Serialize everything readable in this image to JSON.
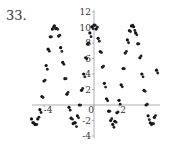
{
  "problem_number": "33.",
  "chart_data": {
    "type": "scatter",
    "title": "",
    "xlabel": "",
    "ylabel": "",
    "xlim": [
      -5.2,
      6.2
    ],
    "ylim": [
      -4.5,
      12.5
    ],
    "grid": false,
    "legend": null,
    "x_ticks": [
      -4,
      0,
      2
    ],
    "x_tick_labels": [
      "-4",
      "0",
      "2"
    ],
    "y_ticks": [
      -4,
      -2,
      2,
      4,
      6,
      8,
      10,
      12
    ],
    "y_tick_labels": [
      "-4",
      "-2",
      "2",
      "4",
      "6",
      "8",
      "10",
      "12"
    ],
    "approx_model": "y ≈ 4 + 6.3·cos(1.57·(x − 0.15))",
    "points": [
      [
        -5.0,
        -1.8
      ],
      [
        -4.83,
        -2.3
      ],
      [
        -4.67,
        -2.5
      ],
      [
        -4.5,
        -1.8
      ],
      [
        -4.33,
        -0.6
      ],
      [
        -4.17,
        1.1
      ],
      [
        -4.0,
        3.1
      ],
      [
        -3.83,
        5.1
      ],
      [
        -3.67,
        7.2
      ],
      [
        -3.5,
        8.8
      ],
      [
        -3.33,
        9.8
      ],
      [
        -3.17,
        10.2
      ],
      [
        -3.0,
        9.9
      ],
      [
        -2.83,
        8.9
      ],
      [
        -2.67,
        7.4
      ],
      [
        -2.5,
        5.5
      ],
      [
        -2.33,
        3.4
      ],
      [
        -2.17,
        1.4
      ],
      [
        -2.0,
        -0.3
      ],
      [
        -1.83,
        -1.7
      ],
      [
        -1.67,
        -2.4
      ],
      [
        -1.5,
        -2.3
      ],
      [
        -1.33,
        -1.4
      ],
      [
        -1.17,
        0.0
      ],
      [
        -1.0,
        1.9
      ],
      [
        -0.83,
        4.0
      ],
      [
        -0.67,
        6.1
      ],
      [
        -0.5,
        7.9
      ],
      [
        -0.33,
        9.3
      ],
      [
        -0.17,
        10.1
      ],
      [
        0.0,
        10.3
      ],
      [
        0.17,
        9.8
      ],
      [
        0.33,
        8.6
      ],
      [
        0.5,
        6.9
      ],
      [
        0.67,
        4.9
      ],
      [
        0.83,
        2.8
      ],
      [
        1.0,
        0.8
      ],
      [
        1.17,
        -0.8
      ],
      [
        1.33,
        -2.0
      ],
      [
        1.5,
        -2.5
      ],
      [
        1.67,
        -2.1
      ],
      [
        1.83,
        -1.0
      ],
      [
        2.0,
        0.6
      ],
      [
        2.17,
        2.6
      ],
      [
        2.33,
        4.7
      ],
      [
        2.5,
        6.7
      ],
      [
        2.67,
        8.4
      ],
      [
        2.83,
        9.6
      ],
      [
        3.0,
        10.2
      ],
      [
        3.17,
        10.1
      ],
      [
        3.33,
        9.3
      ],
      [
        3.5,
        7.9
      ],
      [
        3.67,
        6.1
      ],
      [
        3.83,
        4.0
      ],
      [
        4.0,
        1.9
      ],
      [
        4.17,
        0.0
      ],
      [
        4.33,
        -1.4
      ],
      [
        4.5,
        -2.3
      ],
      [
        4.67,
        -2.4
      ],
      [
        4.83,
        -1.6
      ],
      [
        5.0,
        4.5
      ]
    ]
  }
}
